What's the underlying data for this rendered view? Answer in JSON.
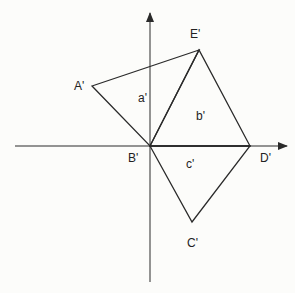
{
  "diagram": {
    "background": "#fcfcfa",
    "stroke": "#2a2a2a",
    "axes": {
      "origin": [
        150,
        146
      ],
      "x_axis": {
        "from": [
          15,
          146
        ],
        "to": [
          287,
          146
        ]
      },
      "y_axis": {
        "from": [
          150,
          282
        ],
        "to": [
          150,
          13
        ]
      }
    },
    "points": {
      "A": {
        "label": "A'",
        "xy": [
          92,
          86
        ],
        "label_xy": [
          80,
          88
        ]
      },
      "B": {
        "label": "B'",
        "xy": [
          150,
          146
        ],
        "label_xy": [
          135,
          162
        ]
      },
      "C": {
        "label": "C'",
        "xy": [
          192,
          222
        ],
        "label_xy": [
          193,
          247
        ]
      },
      "D": {
        "label": "D'",
        "xy": [
          250,
          146
        ],
        "label_xy": [
          267,
          162
        ]
      },
      "E": {
        "label": "E'",
        "xy": [
          199,
          50
        ],
        "label_xy": [
          195,
          38
        ]
      }
    },
    "regions": {
      "a": {
        "label": "a'",
        "label_xy": [
          143,
          101
        ]
      },
      "b": {
        "label": "b'",
        "label_xy": [
          202,
          119
        ]
      },
      "c": {
        "label": "c'",
        "label_xy": [
          192,
          167
        ]
      }
    }
  }
}
